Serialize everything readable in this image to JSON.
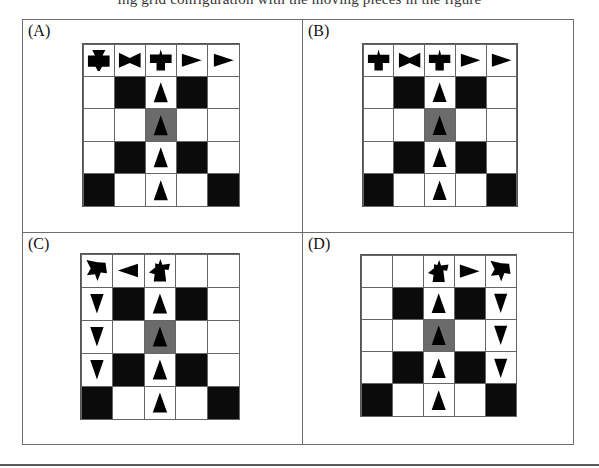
{
  "header_fragment": "ing grid configuration with the moving pieces in the figure",
  "colors": {
    "black_cell": "#0b0b0b",
    "gray_cell": "#6b6b6b",
    "white_cell": "#ffffff",
    "glyph": "#000000",
    "frame": "#6e6e6e"
  },
  "panels": [
    {
      "label": "(A)",
      "cells": [
        [
          "cross",
          "bowtie",
          "bird",
          "arrow-right",
          "arrow-right"
        ],
        [
          "white",
          "black",
          "arrow-up",
          "black",
          "white"
        ],
        [
          "white",
          "white",
          "arrow-up-gray",
          "white",
          "white"
        ],
        [
          "white",
          "black",
          "arrow-up",
          "black",
          "white"
        ],
        [
          "black",
          "white",
          "arrow-up",
          "white",
          "black"
        ]
      ]
    },
    {
      "label": "(B)",
      "cells": [
        [
          "bird",
          "bowtie",
          "bird",
          "arrow-right",
          "arrow-right"
        ],
        [
          "white",
          "black",
          "arrow-up",
          "black",
          "white"
        ],
        [
          "white",
          "white",
          "arrow-up-gray",
          "white",
          "white"
        ],
        [
          "white",
          "black",
          "arrow-up",
          "black",
          "white"
        ],
        [
          "black",
          "white",
          "arrow-up",
          "white",
          "black"
        ]
      ]
    },
    {
      "label": "(C)",
      "cells": [
        [
          "tilted-star",
          "arrow-left",
          "tilted-bird",
          "white",
          "white"
        ],
        [
          "arrow-down",
          "black",
          "arrow-up",
          "black",
          "white"
        ],
        [
          "arrow-down",
          "white",
          "arrow-up-gray",
          "white",
          "white"
        ],
        [
          "arrow-down",
          "black",
          "arrow-up",
          "black",
          "white"
        ],
        [
          "black",
          "white",
          "arrow-up",
          "white",
          "black"
        ]
      ]
    },
    {
      "label": "(D)",
      "cells": [
        [
          "white",
          "white",
          "tilted-bird",
          "arrow-right",
          "tilted-star"
        ],
        [
          "white",
          "black",
          "arrow-up",
          "black",
          "arrow-down"
        ],
        [
          "white",
          "white",
          "arrow-up-gray",
          "white",
          "arrow-down"
        ],
        [
          "white",
          "black",
          "arrow-up",
          "black",
          "arrow-down"
        ],
        [
          "black",
          "white",
          "arrow-up",
          "white",
          "black"
        ]
      ]
    }
  ]
}
